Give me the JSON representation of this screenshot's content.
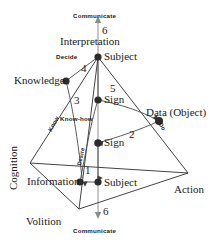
{
  "diagram": {
    "type": "tetrahedron-node-link",
    "colors": {
      "line": "#3a3a3a",
      "node": "#2b2b2b",
      "axis": "#8c8c8c",
      "text": "#1a1a1a"
    },
    "vertices": [
      {
        "id": "interpretation",
        "label": "Interpretation",
        "x": 98,
        "y": 47
      },
      {
        "id": "cognition",
        "label": "Cognition",
        "x": 14,
        "y": 160
      },
      {
        "id": "action",
        "label": "Action",
        "x": 188,
        "y": 181
      },
      {
        "id": "volition",
        "label": "Volition",
        "x": 50,
        "y": 222
      }
    ],
    "nodes": [
      {
        "id": "subject-top",
        "label": "Subject",
        "x": 98,
        "y": 57
      },
      {
        "id": "knowledge",
        "label": "Knowledge",
        "x": 66,
        "y": 81
      },
      {
        "id": "sign-upper",
        "label": "Sign",
        "x": 98,
        "y": 100
      },
      {
        "id": "data-object",
        "label": "Data (Object)",
        "x": 159,
        "y": 121
      },
      {
        "id": "sign-lower",
        "label": "Sign",
        "x": 98,
        "y": 143
      },
      {
        "id": "information",
        "label": "Information",
        "x": 80,
        "y": 182
      },
      {
        "id": "subject-bottom",
        "label": "Subject",
        "x": 98,
        "y": 182
      }
    ],
    "axis": {
      "label_top": "Communicate",
      "label_bottom": "Communicate",
      "number_top": "6",
      "number_bottom": "6"
    },
    "edge_numbers": [
      {
        "id": "edge-1",
        "value": "1",
        "x": 88,
        "y": 170
      },
      {
        "id": "edge-2",
        "value": "2",
        "x": 132,
        "y": 135
      },
      {
        "id": "edge-3",
        "value": "3",
        "x": 77,
        "y": 101
      },
      {
        "id": "edge-4",
        "value": "4",
        "x": 84,
        "y": 68
      },
      {
        "id": "edge-5",
        "value": "5",
        "x": 113,
        "y": 89
      }
    ],
    "edge_labels": [
      {
        "id": "decide",
        "label": "Decide",
        "x": 63,
        "y": 54
      },
      {
        "id": "know",
        "label": "Know",
        "x": 52,
        "y": 126
      },
      {
        "id": "know-how",
        "label": "Know-how",
        "x": 66,
        "y": 119
      },
      {
        "id": "desire",
        "label": "Desire",
        "x": 80,
        "y": 162
      },
      {
        "id": "do",
        "label": "Do",
        "x": 163,
        "y": 124
      }
    ]
  }
}
